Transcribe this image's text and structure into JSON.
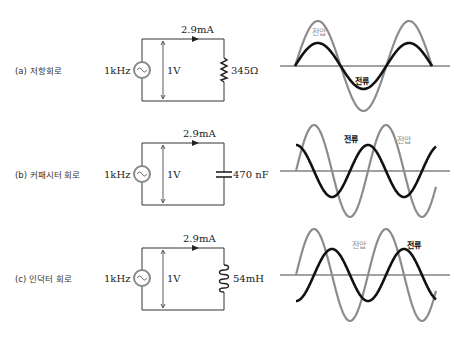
{
  "figure": {
    "panels": [
      {
        "id": "a",
        "caption": "(a) 저항회로",
        "source_freq": "1kHz",
        "source_voltage": "1V",
        "current": "2.9mA",
        "component": "resistor",
        "component_value": "345Ω",
        "waveform": {
          "voltage_label": "전압",
          "current_label": "전류",
          "phase_relation": "in-phase"
        }
      },
      {
        "id": "b",
        "caption": "(b) 커패시터 회로",
        "source_freq": "1kHz",
        "source_voltage": "1V",
        "current": "2.9mA",
        "component": "capacitor",
        "component_value": "470 nF",
        "waveform": {
          "voltage_label": "전압",
          "current_label": "전류",
          "phase_relation": "current leads voltage by 90°"
        }
      },
      {
        "id": "c",
        "caption": "(c) 인덕터 회로",
        "source_freq": "1kHz",
        "source_voltage": "1V",
        "current": "2.9mA",
        "component": "inductor",
        "component_value": "54mH",
        "waveform": {
          "voltage_label": "전압",
          "current_label": "전류",
          "phase_relation": "current lags voltage by 90°"
        }
      }
    ],
    "colors": {
      "wire": "#333333",
      "voltage_wave": "#8c8c8c",
      "current_wave": "#111111",
      "axis": "#444444",
      "voltage_label": "#8c8c8c",
      "current_label": "#111111"
    }
  }
}
